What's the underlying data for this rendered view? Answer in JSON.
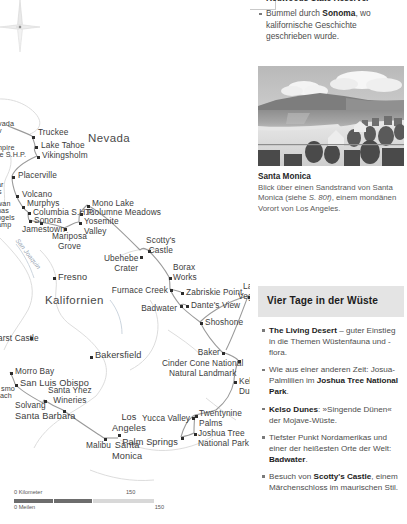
{
  "document": {
    "type": "travel-guide-page",
    "language": "de"
  },
  "intro_bullets": {
    "continuation_line": "Redwoods State Reserve.",
    "items": [
      {
        "pre": "Bummel durch ",
        "bold": "Sonoma",
        "post": ", wo kalifornische Geschichte geschrieben wurde."
      }
    ]
  },
  "photo": {
    "alt": "Santa Monica beach panorama",
    "title": "Santa Monica",
    "caption_pre": "Blick über einen Sandstrand von Santa Monica (siehe ",
    "caption_italic": "S. 80f)",
    "caption_post": ", einem mondänen Vorort von Los Angeles."
  },
  "infobox": {
    "title": "Vier Tage in der Wüste",
    "bg": "#e4e4e4",
    "items": [
      {
        "bold_lead": "The Living Desert",
        "text": " – guter Einstieg in die Themen Wüstenfauna und -flora."
      },
      {
        "pre": "Wie aus einer anderen Zeit: Josua-Palmlilien im ",
        "bold": "Joshua Tree National Park",
        "post": "."
      },
      {
        "bold_lead": "Kelso Dunes",
        "text": ": »Singende Dünen« der Mojave-Wüste."
      },
      {
        "pre": "Tiefster Punkt Nordamerikas und einer der heißesten Orte der Welt: ",
        "bold": "Badwater",
        "post": "."
      },
      {
        "pre": "Besuch von ",
        "bold": "Scotty's Castle",
        "post": ", einem Märchenschloss im maurischen Stil."
      }
    ]
  },
  "map": {
    "region_labels": [
      {
        "text": "Nevada",
        "x": 88,
        "y": 139,
        "cls": "big"
      },
      {
        "text": "Kalifornien",
        "x": 45,
        "y": 300,
        "cls": "big"
      }
    ],
    "water_labels": [
      {
        "text": "San Joaquin",
        "x": 14,
        "y": 255
      }
    ],
    "cities": [
      {
        "name": "Truckee",
        "lx": 36,
        "ly": 130,
        "dx": 32,
        "dy": 136,
        "align": "left"
      },
      {
        "name": "Lake Tahoe",
        "lx": 40,
        "ly": 142,
        "dx": 35,
        "dy": 146,
        "align": "left"
      },
      {
        "name": "Vikingsholm",
        "lx": 41,
        "ly": 152,
        "dx": 37,
        "dy": 156,
        "align": "left"
      },
      {
        "name": "Placerville",
        "lx": 17,
        "ly": 172,
        "dx": 12,
        "dy": 176,
        "align": "left"
      },
      {
        "name": "Volcano",
        "lx": 21,
        "ly": 191,
        "dx": 16,
        "dy": 195,
        "align": "left"
      },
      {
        "name": "Murphys",
        "lx": 25,
        "ly": 199,
        "dx": 22,
        "dy": 206,
        "align": "left"
      },
      {
        "name": "Columbia S.H.P.",
        "lx": 32,
        "ly": 208,
        "dx": 28,
        "dy": 212,
        "align": "left"
      },
      {
        "name": "Sonora",
        "lx": 33,
        "ly": 216,
        "dx": 29,
        "dy": 220,
        "align": "left"
      },
      {
        "name": "Jamestown",
        "lx": 22,
        "ly": 224,
        "dx": 40,
        "dy": 222,
        "align": "left"
      },
      {
        "name": "Mariposa\nGrove",
        "lx": 54,
        "ly": 231,
        "dx": 64,
        "dy": 228,
        "align": "ctr"
      },
      {
        "name": "Mono Lake",
        "lx": 91,
        "ly": 200,
        "dx": 87,
        "dy": 205,
        "align": "left"
      },
      {
        "name": "Tuolumne Meadows",
        "lx": 84,
        "ly": 209,
        "dx": 80,
        "dy": 213,
        "align": "left"
      },
      {
        "name": "Yosemite\nValley",
        "lx": 83,
        "ly": 218,
        "dx": 79,
        "dy": 222,
        "align": "left"
      },
      {
        "name": "Fresno",
        "lx": 21,
        "ly": 280,
        "dx": 53,
        "dy": 277,
        "align": "left"
      },
      {
        "name": "Scotty's\nCastle",
        "lx": 149,
        "ly": 238,
        "dx": 148,
        "dy": 250,
        "align": "left"
      },
      {
        "name": "Ubehebe\nCrater",
        "lx": 113,
        "ly": 258,
        "dx": 140,
        "dy": 256,
        "align": "left"
      },
      {
        "name": "Borax\nWorks",
        "lx": 172,
        "ly": 265,
        "dx": 169,
        "dy": 277,
        "align": "left"
      },
      {
        "name": "Furnace Creek",
        "lx": 120,
        "ly": 290,
        "dx": 170,
        "dy": 289,
        "align": "left"
      },
      {
        "name": "Zabriskie Point",
        "lx": 186,
        "ly": 289,
        "dx": 181,
        "dy": 292,
        "align": "left"
      },
      {
        "name": "Dante's View",
        "lx": 190,
        "ly": 302,
        "dx": 186,
        "dy": 305,
        "align": "left"
      },
      {
        "name": "Badwater",
        "lx": 149,
        "ly": 307,
        "dx": 180,
        "dy": 305,
        "align": "left"
      },
      {
        "name": "Shoshone",
        "lx": 205,
        "ly": 318,
        "dx": 200,
        "dy": 322,
        "align": "left"
      },
      {
        "name": "Las\nVegas",
        "lx": 241,
        "ly": 283,
        "dx": 248,
        "dy": 296,
        "align": "left"
      },
      {
        "name": "Baker",
        "lx": 206,
        "ly": 353,
        "dx": 222,
        "dy": 352,
        "align": "left"
      },
      {
        "name": "Cinder Cone National\nNatural Landmark",
        "lx": 168,
        "ly": 364,
        "dx": 238,
        "dy": 360,
        "align": "left"
      },
      {
        "name": "Kelso\nDunes",
        "lx": 238,
        "ly": 377,
        "dx": 234,
        "dy": 381,
        "align": "left"
      },
      {
        "name": "Bakersfield",
        "lx": 94,
        "ly": 352,
        "dx": 90,
        "dy": 356,
        "align": "left"
      },
      {
        "name": "Morro Bay",
        "lx": 14,
        "ly": 368,
        "dx": 10,
        "dy": 372,
        "align": "left"
      },
      {
        "name": "San Luis Obispo",
        "lx": 20,
        "ly": 380,
        "dx": 15,
        "dy": 384,
        "align": "left"
      },
      {
        "name": "Santa Ynez\nWineries",
        "lx": 50,
        "ly": 389,
        "dx": 44,
        "dy": 400,
        "align": "left"
      },
      {
        "name": "Solvang",
        "lx": 20,
        "ly": 404,
        "dx": 43,
        "dy": 403,
        "align": "left"
      },
      {
        "name": "Santa Barbara",
        "lx": 16,
        "ly": 413,
        "dx": 63,
        "dy": 410,
        "align": "left"
      },
      {
        "name": "Malibu",
        "lx": 86,
        "ly": 441,
        "dx": 104,
        "dy": 438,
        "align": "left"
      },
      {
        "name": "Los\nAngeles",
        "lx": 115,
        "ly": 414,
        "dx": 118,
        "dy": 434,
        "align": "left"
      },
      {
        "name": "Santa\nMonica",
        "lx": 115,
        "ly": 441,
        "dx": 118,
        "dy": 438,
        "align": "left"
      },
      {
        "name": "Yucca Valley",
        "lx": 157,
        "ly": 414,
        "dx": 192,
        "dy": 417,
        "align": "left"
      },
      {
        "name": "Twentynine\nPalms",
        "lx": 199,
        "ly": 412,
        "dx": 195,
        "dy": 415,
        "align": "left"
      },
      {
        "name": "Joshua Tree\nNational Park",
        "lx": 198,
        "ly": 431,
        "dx": 194,
        "dy": 433,
        "align": "left"
      },
      {
        "name": "Palm Springs",
        "lx": 130,
        "ly": 440,
        "dx": 181,
        "dy": 437,
        "align": "left"
      },
      {
        "name": "arst Castle",
        "lx": -2,
        "ly": 335,
        "dx": 30,
        "dy": 337,
        "align": "left"
      }
    ],
    "edge_labels": [
      {
        "text": "vada",
        "x": -2,
        "y": 123
      },
      {
        "text": "v",
        "x": -2,
        "y": 130
      },
      {
        "text": "npire",
        "x": -2,
        "y": 147
      },
      {
        "text": "line S.H.P.",
        "x": -7,
        "y": 154
      },
      {
        "text": "ar",
        "x": -3,
        "y": 184
      },
      {
        "text": "s",
        "x": -2,
        "y": 191
      },
      {
        "text": "wan",
        "x": -3,
        "y": 203
      },
      {
        "text": "nas",
        "x": -3,
        "y": 210
      },
      {
        "text": "ngels",
        "x": -3,
        "y": 216
      },
      {
        "text": "amp",
        "x": -3,
        "y": 223
      },
      {
        "text": "smo",
        "x": 1,
        "y": 388
      },
      {
        "text": "ach",
        "x": 0,
        "y": 395
      }
    ],
    "scale": {
      "km_label": "0 Kilometer",
      "km_value": "150",
      "mi_label": "0 Meilen",
      "mi_value": "150"
    }
  }
}
